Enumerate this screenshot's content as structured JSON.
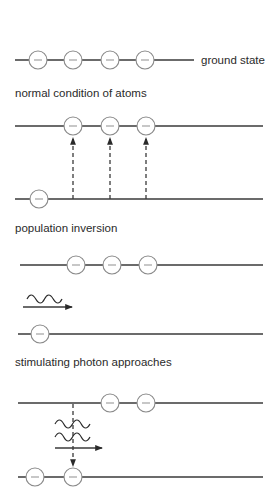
{
  "diagram": {
    "panels": [
      {
        "id": "ground",
        "levels_label": "ground state",
        "caption": "normal condition of atoms"
      },
      {
        "id": "excitation",
        "caption": "population inversion"
      },
      {
        "id": "inversion",
        "caption": "stimulating photon approaches"
      },
      {
        "id": "emission",
        "caption": ""
      }
    ],
    "atom_symbol": "−",
    "icons": {
      "atom": "electron-circle-icon",
      "photon": "wave-icon",
      "arrow": "arrow-icon"
    }
  }
}
